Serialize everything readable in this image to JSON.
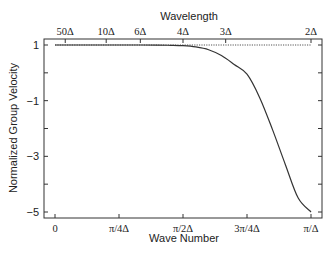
{
  "chart_data": {
    "type": "line",
    "title": "",
    "xlabel": "Wave Number",
    "ylabel": "Normalized Group Velocity",
    "top_xlabel": "Wavelength",
    "xlim": [
      0,
      1
    ],
    "ylim": [
      -5.25,
      1.2
    ],
    "grid": false,
    "x_ticks": [
      {
        "value": 0,
        "label": "0"
      },
      {
        "value": 0.25,
        "label": "π/4Δ"
      },
      {
        "value": 0.5,
        "label": "π/2Δ"
      },
      {
        "value": 0.75,
        "label": "3π/4Δ"
      },
      {
        "value": 1.0,
        "label": "π/Δ"
      }
    ],
    "top_ticks": [
      {
        "value": 0.04,
        "label": "50Δ"
      },
      {
        "value": 0.2,
        "label": "10Δ"
      },
      {
        "value": 0.3333,
        "label": "6Δ"
      },
      {
        "value": 0.5,
        "label": "4Δ"
      },
      {
        "value": 0.6667,
        "label": "3Δ"
      },
      {
        "value": 1.0,
        "label": "2Δ"
      }
    ],
    "y_ticks": [
      {
        "value": 1,
        "label": "1"
      },
      {
        "value": 0,
        "label": ""
      },
      {
        "value": -1,
        "label": "−1"
      },
      {
        "value": -2,
        "label": ""
      },
      {
        "value": -3,
        "label": "−3"
      },
      {
        "value": -4,
        "label": ""
      },
      {
        "value": -5,
        "label": "−5"
      }
    ],
    "series": [
      {
        "name": "numerical group velocity",
        "style": "solid",
        "x": [
          0,
          0.1,
          0.2,
          0.3,
          0.4,
          0.45,
          0.5,
          0.55,
          0.6,
          0.65,
          0.7,
          0.75,
          0.8,
          0.85,
          0.9,
          0.95,
          1.0
        ],
        "values": [
          1,
          1,
          1,
          1,
          0.998,
          0.99,
          0.975,
          0.93,
          0.83,
          0.62,
          0.3,
          -0.05,
          -0.9,
          -2.05,
          -3.3,
          -4.5,
          -5
        ]
      },
      {
        "name": "exact group velocity",
        "style": "dotted",
        "x": [
          0,
          1.0
        ],
        "values": [
          1,
          1
        ]
      }
    ]
  }
}
